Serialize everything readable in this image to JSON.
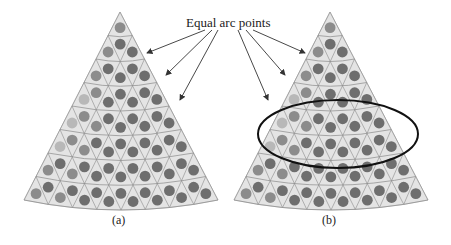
{
  "annotation": {
    "label": "Equal arc points"
  },
  "panels": [
    {
      "id": "a",
      "caption": "(a)",
      "apex": [
        120,
        12
      ],
      "bottom_left": [
        24,
        200
      ],
      "bottom_right": [
        218,
        200
      ],
      "rows": 8,
      "highlight_ellipse": false
    },
    {
      "id": "b",
      "caption": "(b)",
      "apex": [
        330,
        12
      ],
      "bottom_left": [
        234,
        200
      ],
      "bottom_right": [
        428,
        200
      ],
      "rows": 8,
      "highlight_ellipse": true,
      "ellipse": {
        "cx": 338,
        "cy": 134,
        "rx": 80,
        "ry": 34
      }
    }
  ],
  "colors": {
    "fan_fill": "#e4e4e4",
    "grid_line": "#8a8a8a",
    "circle_dark": "#6e6e6e",
    "circle_mid": "#8c8c8c",
    "circle_light": "#b8b8b8",
    "arrow": "#333333",
    "ellipse": "#111111"
  }
}
